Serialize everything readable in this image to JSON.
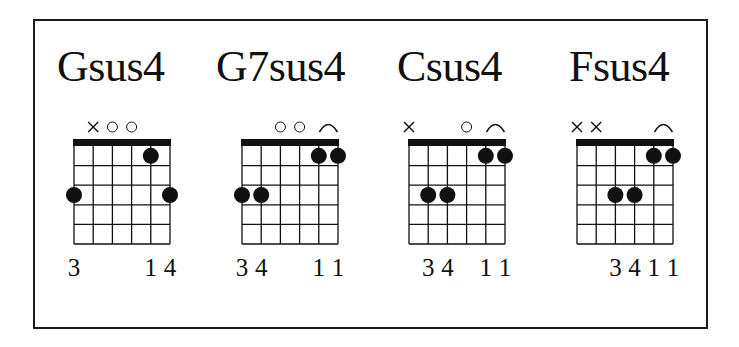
{
  "figure": {
    "type": "guitar-chord-chart",
    "strings": [
      "E",
      "A",
      "D",
      "G",
      "B",
      "e"
    ],
    "frets_shown": 5,
    "colors": {
      "ink": "#111111",
      "background": "#ffffff"
    }
  },
  "chords": [
    {
      "name": "Gsus4",
      "open_muted": [
        "",
        "x",
        "o",
        "o",
        "",
        ""
      ],
      "barre": null,
      "dots": [
        {
          "string": 1,
          "fret": 3
        },
        {
          "string": 5,
          "fret": 1
        },
        {
          "string": 6,
          "fret": 3
        }
      ],
      "fingers": [
        "3",
        "",
        "",
        "",
        "1",
        "4"
      ],
      "fingers_label": "3        14",
      "layout": {
        "grid_left": 74,
        "title_left": 57
      }
    },
    {
      "name": "G7sus4",
      "open_muted": [
        "",
        "",
        "o",
        "o",
        "",
        ""
      ],
      "barre": {
        "from": 5,
        "to": 6,
        "fret": 1
      },
      "dots": [
        {
          "string": 1,
          "fret": 3
        },
        {
          "string": 2,
          "fret": 3
        },
        {
          "string": 5,
          "fret": 1
        },
        {
          "string": 6,
          "fret": 1
        }
      ],
      "fingers": [
        "3",
        "4",
        "",
        "",
        "1",
        "1"
      ],
      "fingers_label": "34     11",
      "layout": {
        "grid_left": 242,
        "title_left": 216
      }
    },
    {
      "name": "Csus4",
      "open_muted": [
        "x",
        "",
        "",
        "o",
        "",
        ""
      ],
      "barre": {
        "from": 5,
        "to": 6,
        "fret": 1
      },
      "dots": [
        {
          "string": 2,
          "fret": 3
        },
        {
          "string": 3,
          "fret": 3
        },
        {
          "string": 5,
          "fret": 1
        },
        {
          "string": 6,
          "fret": 1
        }
      ],
      "fingers": [
        "",
        "3",
        "4",
        "",
        "1",
        "1"
      ],
      "fingers_label": "34   11",
      "layout": {
        "grid_left": 409,
        "title_left": 397
      }
    },
    {
      "name": "Fsus4",
      "open_muted": [
        "x",
        "x",
        "",
        "",
        "",
        ""
      ],
      "barre": {
        "from": 5,
        "to": 6,
        "fret": 1
      },
      "dots": [
        {
          "string": 3,
          "fret": 3
        },
        {
          "string": 4,
          "fret": 3
        },
        {
          "string": 5,
          "fret": 1
        },
        {
          "string": 6,
          "fret": 1
        }
      ],
      "fingers": [
        "",
        "",
        "3",
        "4",
        "1",
        "1"
      ],
      "fingers_label": "3411",
      "layout": {
        "grid_left": 577,
        "title_left": 569
      }
    }
  ]
}
